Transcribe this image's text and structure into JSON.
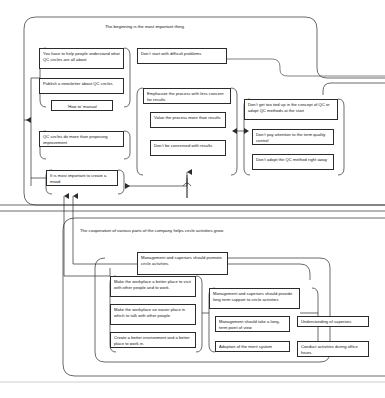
{
  "diagram": {
    "line_color": "#2b2b2b",
    "background": "#ffffff",
    "sections": [
      {
        "id": "section-beginning",
        "title": "The beginning is the most important thing.",
        "nodes": [
          {
            "id": "help-people",
            "text": "You have to help people understand what QC circles are all about"
          },
          {
            "id": "newsletter",
            "text": "Publish a newsletter about QC circles"
          },
          {
            "id": "how-to-manual",
            "text": "‘How to’ manual"
          },
          {
            "id": "more-than-proposing",
            "text": "QC circles do more than proposing improvement"
          },
          {
            "id": "create-a-mood",
            "text": "It is most important to create a mood"
          },
          {
            "id": "dont-start-difficult",
            "text": "Don’t start with difficult problems"
          },
          {
            "id": "emphasize-process",
            "text": "Emphasize the process with less concern for results"
          },
          {
            "id": "value-process",
            "text": "Value the process more than results"
          },
          {
            "id": "dont-be-concerned",
            "text": "Don’t be concerned with results"
          },
          {
            "id": "dont-get-tied-up",
            "text": "Don’t get too tied up in the concept of QC or adopt QC methods at the start"
          },
          {
            "id": "dont-pay-attention",
            "text": "Don’t pay attention to the term quality control"
          },
          {
            "id": "dont-adopt-method",
            "text": "Don’t adopt the QC method right away"
          }
        ]
      },
      {
        "id": "section-cooperation",
        "title": "The cooperation of various parts of the company helps circle activities grow.",
        "nodes": [
          {
            "id": "promote-circle",
            "text": "Management and superiors should promote circle activities."
          },
          {
            "id": "better-place-visit",
            "text": "Make the workplace a better place to visit with other people and to work."
          },
          {
            "id": "easier-place-talk",
            "text": "Make the workplace an easier place in which to talk with other people"
          },
          {
            "id": "better-environment",
            "text": "Create a better environment and a better place to work in."
          },
          {
            "id": "long-term-support",
            "text": "Management and superiors should provide long term support to circle activities"
          },
          {
            "id": "long-term-view",
            "text": "Management should take a long-term point of view"
          },
          {
            "id": "understanding",
            "text": "Understanding of superiors"
          },
          {
            "id": "merit-system",
            "text": "Adoption of the merit system"
          },
          {
            "id": "office-hours",
            "text": "Conduct activities during office hours."
          }
        ]
      }
    ]
  }
}
